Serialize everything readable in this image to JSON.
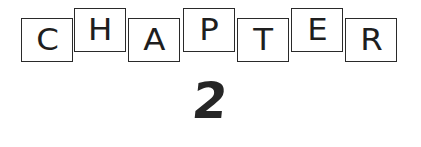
{
  "heading": {
    "word": "CHAPTER",
    "letters": [
      "C",
      "H",
      "A",
      "P",
      "T",
      "E",
      "R"
    ],
    "number": "2"
  },
  "colors": {
    "ink": "#1e1e1e",
    "background": "#ffffff"
  }
}
